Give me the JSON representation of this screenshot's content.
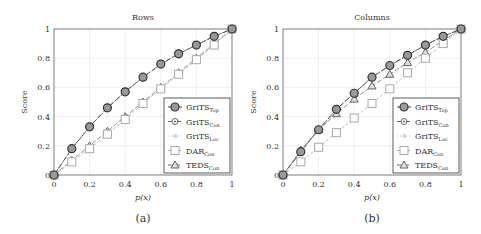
{
  "chart_data": [
    {
      "type": "line",
      "title": "Rows",
      "xlabel": "p(x)",
      "ylabel": "Score",
      "caption": "(a)",
      "xlim": [
        0,
        1
      ],
      "ylim": [
        0,
        1
      ],
      "x_ticks": [
        "0",
        "0.2",
        "0.4",
        "0.6",
        "0.8",
        "1"
      ],
      "y_ticks": [
        "0",
        "0.2",
        "0.4",
        "0.6",
        "0.8",
        "1"
      ],
      "grid": true,
      "legend_position": "lower right",
      "x": [
        0,
        0.1,
        0.2,
        0.3,
        0.4,
        0.5,
        0.6,
        0.7,
        0.8,
        0.9,
        1
      ],
      "series": [
        {
          "name": "GriTS_Top",
          "marker": "circle",
          "values": [
            0,
            0.18,
            0.33,
            0.46,
            0.57,
            0.67,
            0.76,
            0.83,
            0.89,
            0.95,
            1
          ]
        },
        {
          "name": "GriTS_Con",
          "marker": "circle-dot",
          "values": [
            0,
            0.18,
            0.33,
            0.46,
            0.57,
            0.67,
            0.76,
            0.83,
            0.89,
            0.95,
            1
          ]
        },
        {
          "name": "GriTS_Loc",
          "marker": "star",
          "values": [
            0,
            0.18,
            0.33,
            0.46,
            0.57,
            0.67,
            0.76,
            0.83,
            0.89,
            0.95,
            1
          ]
        },
        {
          "name": "DAR_Con",
          "marker": "square",
          "values": [
            0,
            0.09,
            0.18,
            0.28,
            0.38,
            0.49,
            0.59,
            0.69,
            0.79,
            0.89,
            1
          ]
        },
        {
          "name": "TEDS_Con",
          "marker": "triangle",
          "values": [
            0,
            0.1,
            0.2,
            0.3,
            0.4,
            0.5,
            0.6,
            0.7,
            0.8,
            0.9,
            1
          ]
        }
      ]
    },
    {
      "type": "line",
      "title": "Columns",
      "xlabel": "p(x)",
      "ylabel": "Score",
      "caption": "(b)",
      "xlim": [
        0,
        1
      ],
      "ylim": [
        0,
        1
      ],
      "x_ticks": [
        "0",
        "0.2",
        "0.4",
        "0.6",
        "0.8",
        "1"
      ],
      "y_ticks": [
        "0",
        "0.2",
        "0.4",
        "0.6",
        "0.8",
        "1"
      ],
      "grid": true,
      "legend_position": "lower right",
      "x": [
        0,
        0.1,
        0.2,
        0.3,
        0.4,
        0.5,
        0.6,
        0.7,
        0.8,
        0.9,
        1
      ],
      "series": [
        {
          "name": "GriTS_Top",
          "marker": "circle",
          "values": [
            0,
            0.16,
            0.31,
            0.45,
            0.56,
            0.67,
            0.75,
            0.82,
            0.89,
            0.95,
            1
          ]
        },
        {
          "name": "GriTS_Con",
          "marker": "circle-dot",
          "values": [
            0,
            0.16,
            0.31,
            0.45,
            0.56,
            0.67,
            0.75,
            0.82,
            0.89,
            0.95,
            1
          ]
        },
        {
          "name": "GriTS_Loc",
          "marker": "star",
          "values": [
            0,
            0.16,
            0.31,
            0.45,
            0.56,
            0.67,
            0.75,
            0.82,
            0.89,
            0.95,
            1
          ]
        },
        {
          "name": "DAR_Con",
          "marker": "square",
          "values": [
            0,
            0.09,
            0.19,
            0.29,
            0.39,
            0.49,
            0.59,
            0.7,
            0.8,
            0.9,
            1
          ]
        },
        {
          "name": "TEDS_Con",
          "marker": "triangle",
          "values": [
            0,
            0.17,
            0.31,
            0.42,
            0.52,
            0.61,
            0.69,
            0.77,
            0.84,
            0.92,
            1
          ]
        }
      ]
    }
  ],
  "legend": [
    {
      "base": "GriTS",
      "sub": "Top"
    },
    {
      "base": "GriTS",
      "sub": "Con"
    },
    {
      "base": "GriTS",
      "sub": "Loc"
    },
    {
      "base": "DAR",
      "sub": "Con"
    },
    {
      "base": "TEDS",
      "sub": "Con"
    }
  ]
}
